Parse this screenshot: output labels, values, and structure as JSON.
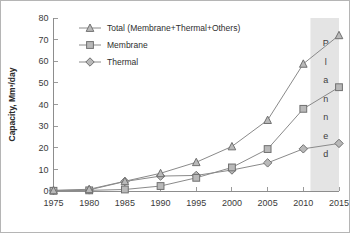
{
  "chart_data": {
    "type": "line",
    "title": "",
    "xlabel": "",
    "ylabel": "Capacity, Mm3/day",
    "ylabel_display": "Capacity, Mm³/day",
    "x": [
      1975,
      1980,
      1985,
      1990,
      1995,
      2000,
      2005,
      2010,
      2015
    ],
    "xtick_labels": [
      "1975",
      "1980",
      "1985",
      "1990",
      "1995",
      "2000",
      "2005",
      "2010",
      "2015"
    ],
    "ytick_labels": [
      "0",
      "10",
      "20",
      "30",
      "40",
      "50",
      "60",
      "70",
      "80"
    ],
    "yticks": [
      0,
      10,
      20,
      30,
      40,
      50,
      60,
      70,
      80
    ],
    "xlim": [
      1975,
      2015
    ],
    "ylim": [
      0,
      80
    ],
    "grid": false,
    "legend_position": "top-left",
    "series": [
      {
        "name": "Total (Membrane+Thermal+Others)",
        "marker": "triangle",
        "color": "#b9b9b9",
        "values": [
          0.3,
          0.8,
          4.5,
          8.2,
          13.3,
          20.6,
          32.8,
          58.8,
          72.0
        ]
      },
      {
        "name": "Membrane",
        "marker": "square",
        "color": "#b9b9b9",
        "values": [
          0.1,
          0.3,
          0.7,
          2.3,
          6.1,
          10.9,
          19.4,
          38.0,
          48.0
        ]
      },
      {
        "name": "Thermal",
        "marker": "diamond",
        "color": "#b9b9b9",
        "values": [
          0.2,
          0.5,
          4.4,
          6.9,
          7.2,
          9.7,
          13.0,
          19.5,
          22.0
        ]
      }
    ],
    "annotations": [
      {
        "name": "planned-band",
        "text": "Planned",
        "letters": [
          "P",
          "l",
          "a",
          "n",
          "n",
          "e",
          "d"
        ],
        "x_start": 2011,
        "x_end": 2015,
        "color": "#e4e4e4"
      }
    ]
  },
  "legend": {
    "entries": [
      {
        "label": "Total (Membrane+Thermal+Others)"
      },
      {
        "label": "Membrane"
      },
      {
        "label": "Thermal"
      }
    ]
  }
}
